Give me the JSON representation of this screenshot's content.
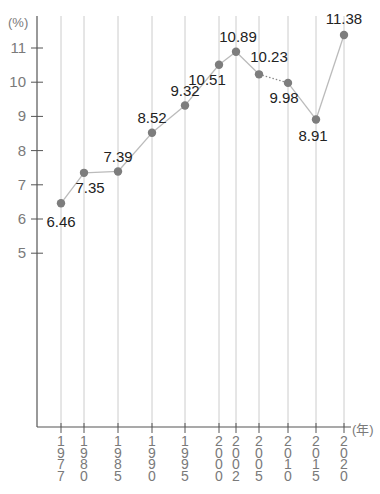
{
  "chart_data": {
    "type": "line",
    "title": "",
    "xlabel": "(年)",
    "ylabel": "(%)",
    "categories": [
      "1977",
      "1980",
      "1985",
      "1990",
      "1995",
      "2000",
      "2002",
      "2005",
      "2010",
      "2015",
      "2020"
    ],
    "values": [
      6.46,
      7.35,
      7.39,
      8.52,
      9.32,
      10.51,
      10.89,
      10.23,
      9.98,
      8.91,
      11.38
    ],
    "data_labels": [
      "6.46",
      "7.35",
      "7.39",
      "8.52",
      "9.32",
      "10.51",
      "10.89",
      "10.23",
      "9.98",
      "8.91",
      "11.38"
    ],
    "y_ticks": [
      5,
      6,
      7,
      8,
      9,
      10,
      11
    ],
    "ylim": [
      0,
      11.9
    ],
    "grid": "vertical lines at each category",
    "legend": null,
    "dashed_segment": [
      "2005",
      "2010"
    ],
    "colors": {
      "axis": "#555555",
      "grid": "#cccccc",
      "line": "#bbbbbb",
      "marker": "#7d7d7d",
      "tick_text": "#7a7a7a",
      "label_text": "#222222"
    }
  }
}
